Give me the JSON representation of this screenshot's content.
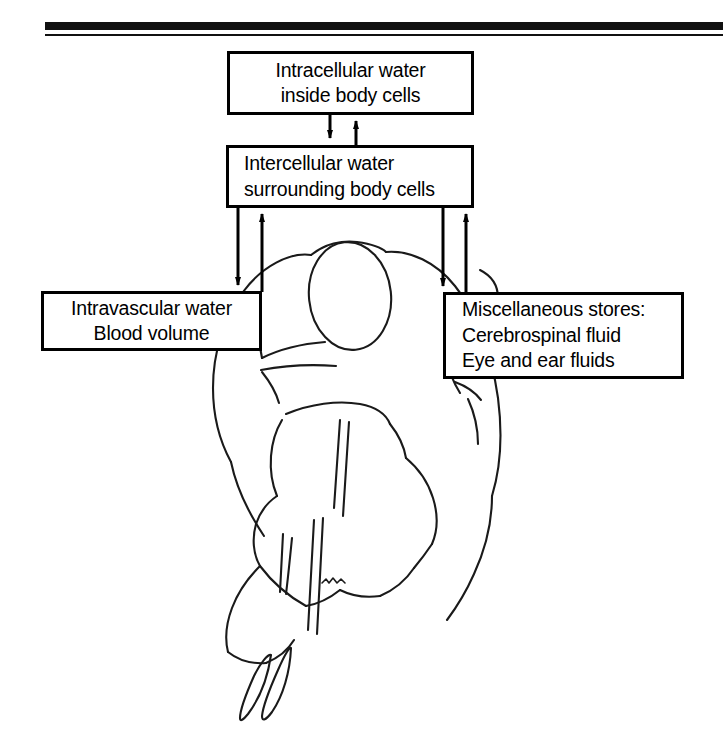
{
  "figure": {
    "top_rule": "thick-black-divider",
    "artwork": "line-drawing-cyclist-rear-view",
    "artwork_signature": "2589",
    "ink_color": "#000000",
    "background_color": "#ffffff"
  },
  "boxes": {
    "intracellular": {
      "name": "Intracellular water box",
      "line1": "Intracellular water",
      "line2": "inside body cells"
    },
    "intercellular": {
      "name": "Intercellular water box",
      "line1": "Intercellular water",
      "line2": "surrounding body cells"
    },
    "intravascular": {
      "name": "Intravascular water box",
      "line1": "Intravascular water",
      "line2": "Blood volume"
    },
    "miscellaneous": {
      "name": "Miscellaneous stores box",
      "line1": "Miscellaneous stores:",
      "line2": "Cerebrospinal fluid",
      "line3": "Eye and ear fluids"
    }
  },
  "connectors": [
    {
      "id": "intracellular-to-intercellular",
      "direction": "down",
      "from": "intracellular",
      "to": "intercellular"
    },
    {
      "id": "intercellular-to-intracellular",
      "direction": "up",
      "from": "intercellular",
      "to": "intracellular"
    },
    {
      "id": "intercellular-to-intravascular",
      "direction": "down",
      "from": "intercellular",
      "to": "intravascular"
    },
    {
      "id": "intravascular-to-intercellular",
      "direction": "up",
      "from": "intravascular",
      "to": "intercellular"
    },
    {
      "id": "intercellular-to-miscellaneous",
      "direction": "down",
      "from": "intercellular",
      "to": "miscellaneous"
    },
    {
      "id": "miscellaneous-to-intercellular",
      "direction": "up",
      "from": "miscellaneous",
      "to": "intercellular"
    }
  ]
}
